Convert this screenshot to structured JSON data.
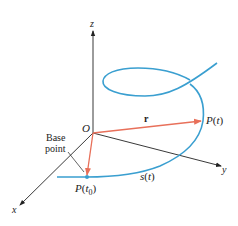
{
  "diagram": {
    "type": "space-curve-arc-length",
    "colors": {
      "curve": "#3a9fd0",
      "vector": "#e8705a",
      "axis": "#222222",
      "text": "#222222"
    },
    "axes": {
      "z": {
        "label": "z"
      },
      "y": {
        "label": "y"
      },
      "x": {
        "label": "x"
      }
    },
    "points": {
      "origin": {
        "label": "O"
      },
      "p_t": {
        "label": "P(t)",
        "name": "P",
        "arg": "t"
      },
      "p_t0": {
        "label": "P(t0)",
        "name": "P",
        "arg": "t",
        "sub": "0"
      }
    },
    "labels": {
      "vector_r": "r",
      "arc_length": "s(t)",
      "arc_name": "s",
      "arc_arg": "t",
      "base_point_line1": "Base",
      "base_point_line2": "point"
    }
  }
}
